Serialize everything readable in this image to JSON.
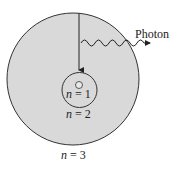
{
  "diagram": {
    "photon_label": "Photon",
    "levels": [
      {
        "n": "1",
        "label_var": "n",
        "label_eq": " = 1"
      },
      {
        "n": "2",
        "label_var": "n",
        "label_eq": " = 2"
      },
      {
        "n": "3",
        "label_var": "n",
        "label_eq": " = 3"
      }
    ],
    "colors": {
      "outer_fill": "#d9d9d9",
      "stroke": "#333333",
      "inner_fill": "#d9d9d9"
    }
  }
}
